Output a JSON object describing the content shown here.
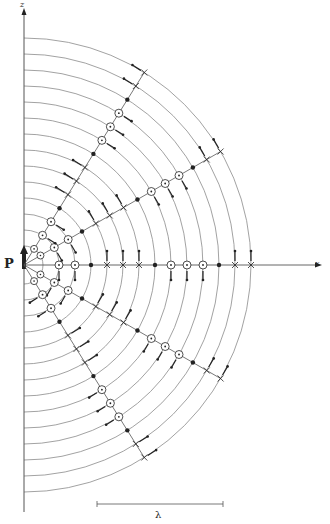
{
  "figure": {
    "type": "dipole-radiation-field-diagram",
    "labels": {
      "z_axis": "z",
      "x_axis": "x",
      "dipole": "P",
      "scale_bar": "λ"
    },
    "colors": {
      "lines": "#555555",
      "arcs": "#8a8a8a",
      "markers": "#222222",
      "background": "#ffffff"
    },
    "geometry": {
      "center": [
        24,
        265
      ],
      "arc_radii_start": 19,
      "arc_radii_step": 16,
      "arc_count": 14,
      "vertical_axis": {
        "x": 24,
        "y_top": 8,
        "y_bottom": 512
      },
      "horizontal_axis": {
        "y": 265,
        "x_start": 24,
        "x_end": 322
      },
      "scale_bar": {
        "x1": 97,
        "x2": 223,
        "y": 504
      }
    },
    "ray_angles_deg": [
      0,
      30,
      58,
      -30,
      -58
    ],
    "marker_sequence": [
      "dot-circle",
      "dot-circle",
      "dot",
      "cross",
      "cross",
      "cross",
      "dot",
      "dot-circle",
      "dot-circle",
      "dot-circle",
      "dot",
      "cross",
      "cross"
    ],
    "marker_sequence_start_index": 1
  }
}
